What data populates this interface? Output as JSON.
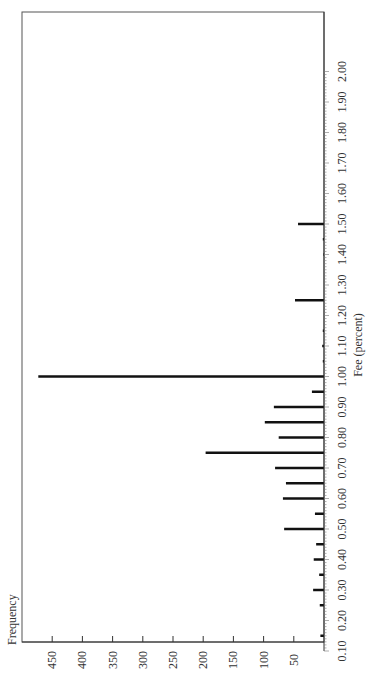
{
  "chart_data": {
    "type": "bar",
    "orientation": "rotated-90",
    "title": "",
    "xlabel": "Fee (percent)",
    "ylabel": "Frequency",
    "xlim": [
      0.1,
      2.0
    ],
    "ylim": [
      0,
      500
    ],
    "x_ticks": [
      "0.10",
      "0.20",
      "0.30",
      "0.40",
      "0.50",
      "0.60",
      "0.70",
      "0.80",
      "0.90",
      "1.00",
      "1.10",
      "1.20",
      "1.30",
      "1.40",
      "1.50",
      "1.60",
      "1.70",
      "1.80",
      "1.90",
      "2.00"
    ],
    "y_ticks": [
      "50",
      "100",
      "150",
      "200",
      "250",
      "300",
      "350",
      "400",
      "450"
    ],
    "grid": false,
    "legend": null,
    "categories": [
      0.15,
      0.25,
      0.3,
      0.35,
      0.4,
      0.45,
      0.5,
      0.55,
      0.6,
      0.65,
      0.7,
      0.75,
      0.8,
      0.85,
      0.9,
      0.95,
      1.0,
      1.05,
      1.1,
      1.15,
      1.25,
      1.4,
      1.45,
      1.5
    ],
    "values": [
      6,
      7,
      18,
      8,
      17,
      13,
      66,
      15,
      68,
      63,
      81,
      196,
      75,
      98,
      83,
      20,
      473,
      2,
      3,
      2,
      48,
      1,
      2,
      43
    ]
  }
}
